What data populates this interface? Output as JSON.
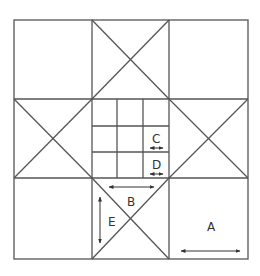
{
  "colors": {
    "line": "#555555",
    "background": "#ffffff",
    "text": "#333333"
  },
  "labels": {
    "A": "A",
    "B": "B",
    "C": "C",
    "D": "D",
    "E": "E"
  }
}
